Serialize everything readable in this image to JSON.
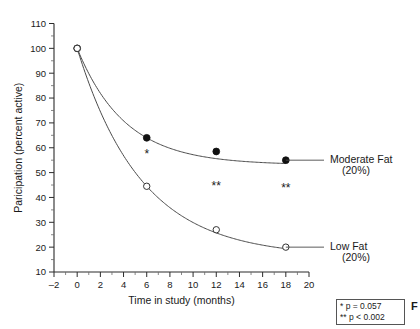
{
  "chart_data": {
    "type": "line",
    "title": "",
    "xlabel": "Time in study (months)",
    "ylabel": "Paricipation (percent active)",
    "xlim": [
      -2,
      20
    ],
    "ylim": [
      10,
      110
    ],
    "xticks": [
      -2,
      0,
      2,
      4,
      6,
      8,
      10,
      12,
      14,
      16,
      18,
      20
    ],
    "xticklabels": [
      "–2",
      "0",
      "2",
      "4",
      "6",
      "8",
      "10",
      "12",
      "14",
      "16",
      "18",
      "20"
    ],
    "yticks": [
      10,
      20,
      30,
      40,
      50,
      60,
      70,
      80,
      90,
      100,
      110
    ],
    "yticklabels": [
      "10",
      "20",
      "30",
      "40",
      "50",
      "60",
      "70",
      "80",
      "90",
      "100",
      "110"
    ],
    "y_minor_step": 5,
    "grid": false,
    "legend_position": "right-of-curves",
    "series": [
      {
        "name": "Moderate Fat (20%)",
        "label_line1": "Moderate Fat",
        "label_line2": "(20%)",
        "marker": "filled-circle",
        "x": [
          0,
          6,
          12,
          18
        ],
        "values": [
          100,
          64,
          58.5,
          55
        ]
      },
      {
        "name": "Low Fat (20%)",
        "label_line1": "Low Fat",
        "label_line2": "(20%)",
        "marker": "open-circle",
        "x": [
          0,
          6,
          12,
          18
        ],
        "values": [
          100,
          44.5,
          27,
          20
        ]
      }
    ],
    "annotations": [
      {
        "text": "*",
        "x": 6,
        "y": 56
      },
      {
        "text": "**",
        "x": 12,
        "y": 43
      },
      {
        "text": "**",
        "x": 18,
        "y": 42
      }
    ]
  },
  "significance_legend": {
    "rows": [
      {
        "mark": "*",
        "text": "p = 0.057"
      },
      {
        "mark": "**",
        "text": "p < 0.002"
      }
    ]
  },
  "caption_fragment": "F",
  "colors": {
    "axis": "#2b2b2b",
    "curve": "#4a4a4a",
    "filled_marker": "#111111",
    "open_marker_fill": "#ffffff",
    "text": "#1a1a1a",
    "legend_border": "#555555",
    "background": "#ffffff"
  }
}
